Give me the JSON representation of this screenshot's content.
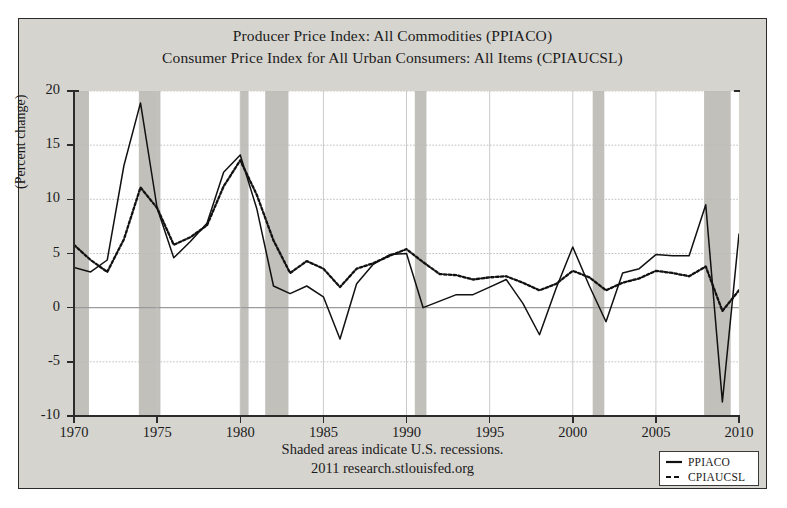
{
  "figure": {
    "title_lines": [
      "Producer Price Index: All Commodities (PPIACO)",
      "Consumer Price Index for All Urban Consumers: All Items (CPIAUCSL)"
    ],
    "footer_lines": [
      "Shaded areas indicate U.S. recessions.",
      "2011 research.stlouisfed.org"
    ],
    "background_color": "#d6d4cf",
    "plot_background_color": "#ffffff",
    "recession_band_color": "#c2c0bb",
    "line_color": "#111111"
  },
  "chart_data": {
    "type": "line",
    "xlabel": "",
    "ylabel": "(Percent change)",
    "xlim": [
      1970,
      2010
    ],
    "ylim": [
      -10,
      20
    ],
    "xticks": [
      1970,
      1975,
      1980,
      1985,
      1990,
      1995,
      2000,
      2005,
      2010
    ],
    "yticks": [
      -10,
      -5,
      0,
      5,
      10,
      15,
      20
    ],
    "grid": true,
    "legend_position": "bottom-right",
    "x": [
      1970,
      1971,
      1972,
      1973,
      1974,
      1975,
      1976,
      1977,
      1978,
      1979,
      1980,
      1981,
      1982,
      1983,
      1984,
      1985,
      1986,
      1987,
      1988,
      1989,
      1990,
      1991,
      1992,
      1993,
      1994,
      1995,
      1996,
      1997,
      1998,
      1999,
      2000,
      2001,
      2002,
      2003,
      2004,
      2005,
      2006,
      2007,
      2008,
      2009,
      2010
    ],
    "series": [
      {
        "name": "PPIACO",
        "style": "solid",
        "values": [
          3.7,
          3.3,
          4.4,
          13.1,
          18.9,
          9.2,
          4.6,
          6.1,
          7.8,
          12.5,
          14.1,
          9.1,
          2.0,
          1.3,
          2.0,
          1.0,
          -2.9,
          2.2,
          4.0,
          4.9,
          5.0,
          0.0,
          0.6,
          1.2,
          1.2,
          1.9,
          2.6,
          0.4,
          -2.5,
          1.8,
          5.6,
          2.0,
          -1.3,
          3.2,
          3.6,
          4.9,
          4.8,
          4.8,
          9.5,
          -8.7,
          6.8
        ]
      },
      {
        "name": "CPIAUCSL",
        "style": "dashed",
        "values": [
          5.8,
          4.4,
          3.3,
          6.3,
          11.1,
          9.2,
          5.8,
          6.5,
          7.6,
          11.2,
          13.6,
          10.4,
          6.2,
          3.2,
          4.3,
          3.6,
          1.9,
          3.6,
          4.1,
          4.8,
          5.4,
          4.2,
          3.1,
          3.0,
          2.6,
          2.8,
          2.9,
          2.3,
          1.6,
          2.2,
          3.4,
          2.8,
          1.6,
          2.3,
          2.7,
          3.4,
          3.2,
          2.9,
          3.8,
          -0.3,
          1.6
        ]
      }
    ],
    "recessions": [
      {
        "start": 1969.9,
        "end": 1970.9
      },
      {
        "start": 1973.9,
        "end": 1975.2
      },
      {
        "start": 1980.0,
        "end": 1980.5
      },
      {
        "start": 1981.5,
        "end": 1982.9
      },
      {
        "start": 1990.5,
        "end": 1991.2
      },
      {
        "start": 2001.2,
        "end": 2001.9
      },
      {
        "start": 2007.9,
        "end": 2009.5
      }
    ]
  },
  "legend": {
    "entries": [
      {
        "label": "PPIACO",
        "style": "solid"
      },
      {
        "label": "CPIAUCSL",
        "style": "dashed"
      }
    ]
  }
}
